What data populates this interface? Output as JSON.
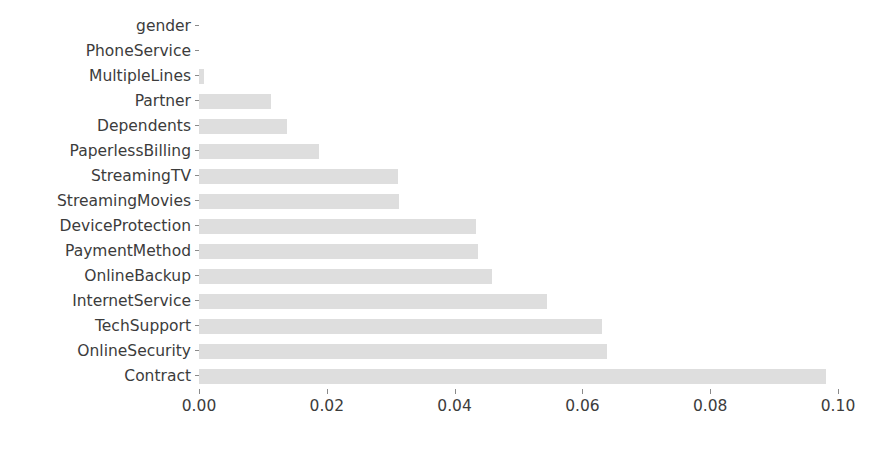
{
  "chart_data": {
    "type": "bar",
    "orientation": "horizontal",
    "title": "",
    "xlabel": "",
    "ylabel": "",
    "xlim": [
      0.0,
      0.105
    ],
    "xticks": [
      0.0,
      0.02,
      0.04,
      0.06,
      0.08,
      0.1
    ],
    "xticklabels": [
      "0.00",
      "0.02",
      "0.04",
      "0.06",
      "0.08",
      "0.10"
    ],
    "grid": false,
    "legend": null,
    "bar_color": "#dedede",
    "text_color": "#3c3c3c",
    "background": "#ffffff",
    "categories": [
      "gender",
      "PhoneService",
      "MultipleLines",
      "Partner",
      "Dependents",
      "PaperlessBilling",
      "StreamingTV",
      "StreamingMovies",
      "DeviceProtection",
      "PaymentMethod",
      "OnlineBackup",
      "InternetService",
      "TechSupport",
      "OnlineSecurity",
      "Contract"
    ],
    "values": [
      0.0,
      0.0,
      0.0008,
      0.0113,
      0.0137,
      0.0188,
      0.0312,
      0.0313,
      0.0433,
      0.0437,
      0.0459,
      0.0545,
      0.063,
      0.0638,
      0.0981
    ]
  }
}
